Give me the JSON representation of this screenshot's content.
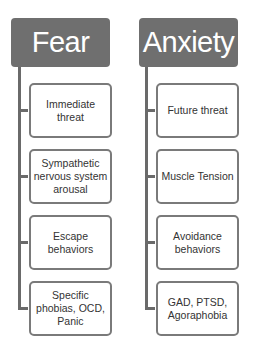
{
  "columns": [
    {
      "title": "Fear",
      "items": [
        {
          "label": "Immediate\nthreat"
        },
        {
          "label": "Sympathetic\nnervous system\narousal"
        },
        {
          "label": "Escape\nbehaviors"
        },
        {
          "label": "Specific\nphobias, OCD,\nPanic"
        }
      ]
    },
    {
      "title": "Anxiety",
      "items": [
        {
          "label": "Future threat"
        },
        {
          "label": "Muscle Tension"
        },
        {
          "label": "Avoidance\nbehaviors"
        },
        {
          "label": "GAD, PTSD,\nAgoraphobia"
        }
      ]
    }
  ],
  "colors": {
    "header_fill": "#6f6f6f",
    "header_text": "#ffffff",
    "connector": "#6a6a6a",
    "box_border": "#7a7a7a"
  }
}
